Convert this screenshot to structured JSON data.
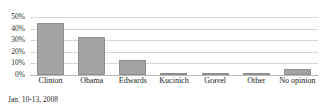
{
  "caption": "Jan. 10-13, 2008",
  "colors": {
    "bar_fill": "#a3a3a3",
    "bar_border": "#8e8e8e",
    "gridline": "#d8d8d8",
    "baseline": "#b8b8b8",
    "text": "#1a1a1a",
    "background": "#ffffff"
  },
  "chart_data": {
    "type": "bar",
    "title": "",
    "subtitle": "",
    "xlabel": "",
    "ylabel": "",
    "categories": [
      "Clinton",
      "Obama",
      "Edwards",
      "Kucinich",
      "Gravel",
      "Other",
      "No opinion"
    ],
    "values": [
      45,
      33,
      13,
      1,
      1,
      1,
      5
    ],
    "ylim": [
      0,
      50
    ],
    "yticks": [
      0,
      10,
      20,
      30,
      40,
      50
    ],
    "ytick_labels": [
      "0%",
      "10%",
      "20%",
      "30%",
      "40%",
      "50%"
    ],
    "grid": true,
    "legend": false,
    "legend_position": "none",
    "annotations": [
      "Jan. 10-13, 2008"
    ]
  }
}
